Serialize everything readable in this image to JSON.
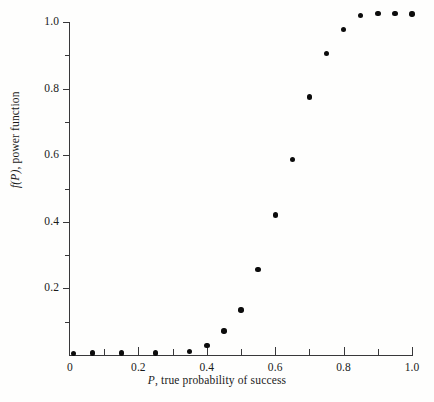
{
  "chart_data": {
    "type": "scatter",
    "title": "",
    "subtitle": "",
    "xlabel_prefix": "P",
    "xlabel_rest": ", true probability of success",
    "ylabel_prefix": "f(P)",
    "ylabel_rest": ", power function",
    "xlim": [
      0,
      1.0
    ],
    "ylim": [
      0,
      1.05
    ],
    "grid": false,
    "legend": null,
    "x_major_ticks": [
      0,
      0.2,
      0.4,
      0.6,
      0.8,
      1.0
    ],
    "x_major_tick_labels": [
      "0",
      "0.2",
      "0.4",
      "0.6",
      "0.8",
      "1.0"
    ],
    "x_minor_ticks": [
      0.1,
      0.3,
      0.5,
      0.7,
      0.9
    ],
    "y_major_ticks": [
      0.2,
      0.4,
      0.6,
      0.8,
      1.0
    ],
    "y_major_tick_labels": [
      "0.2",
      "0.4",
      "0.6",
      "0.8",
      "1.0"
    ],
    "y_minor_ticks": [
      0.1,
      0.3,
      0.5,
      0.7,
      0.9
    ],
    "marker": "filled-circle",
    "marker_color": "#0c0c0c",
    "axis_color": "#38383a",
    "background_color": "#fefefd",
    "x": [
      0.01,
      0.065,
      0.15,
      0.25,
      0.35,
      0.4,
      0.45,
      0.5,
      0.55,
      0.6,
      0.65,
      0.7,
      0.75,
      0.8,
      0.85,
      0.9,
      0.95,
      1.0
    ],
    "y": [
      0.005,
      0.006,
      0.006,
      0.006,
      0.01,
      0.028,
      0.072,
      0.135,
      0.257,
      0.42,
      0.588,
      0.775,
      0.905,
      0.978,
      1.02,
      1.025,
      1.026,
      1.024
    ],
    "points": [
      {
        "x": 0.01,
        "y": 0.005
      },
      {
        "x": 0.065,
        "y": 0.006
      },
      {
        "x": 0.15,
        "y": 0.006
      },
      {
        "x": 0.25,
        "y": 0.006
      },
      {
        "x": 0.35,
        "y": 0.01
      },
      {
        "x": 0.4,
        "y": 0.028
      },
      {
        "x": 0.45,
        "y": 0.072
      },
      {
        "x": 0.5,
        "y": 0.135
      },
      {
        "x": 0.55,
        "y": 0.257
      },
      {
        "x": 0.6,
        "y": 0.42
      },
      {
        "x": 0.65,
        "y": 0.588
      },
      {
        "x": 0.7,
        "y": 0.775
      },
      {
        "x": 0.75,
        "y": 0.905
      },
      {
        "x": 0.8,
        "y": 0.978
      },
      {
        "x": 0.85,
        "y": 1.02
      },
      {
        "x": 0.9,
        "y": 1.025
      },
      {
        "x": 0.95,
        "y": 1.026
      },
      {
        "x": 1.0,
        "y": 1.024
      }
    ]
  }
}
